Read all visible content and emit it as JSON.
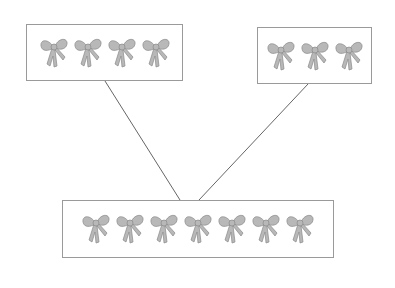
{
  "diagram": {
    "type": "part-part-whole",
    "icon": "ribbon-bow-icon",
    "colors": {
      "bow_fill": "#b8b8b8",
      "bow_stroke": "#8a8a8a",
      "box_border": "#9a9a9a",
      "line": "#666666"
    },
    "boxes": [
      {
        "id": "left-part",
        "count": 4,
        "x": 26,
        "y": 24,
        "w": 157,
        "h": 57
      },
      {
        "id": "right-part",
        "count": 3,
        "x": 257,
        "y": 27,
        "w": 115,
        "h": 57
      },
      {
        "id": "whole",
        "count": 7,
        "x": 62,
        "y": 200,
        "w": 272,
        "h": 58
      }
    ],
    "connectors": [
      {
        "from": "left-part",
        "to": "whole",
        "x1": 105,
        "y1": 81,
        "x2": 180,
        "y2": 200
      },
      {
        "from": "right-part",
        "to": "whole",
        "x1": 308,
        "y1": 84,
        "x2": 199,
        "y2": 200
      }
    ]
  }
}
